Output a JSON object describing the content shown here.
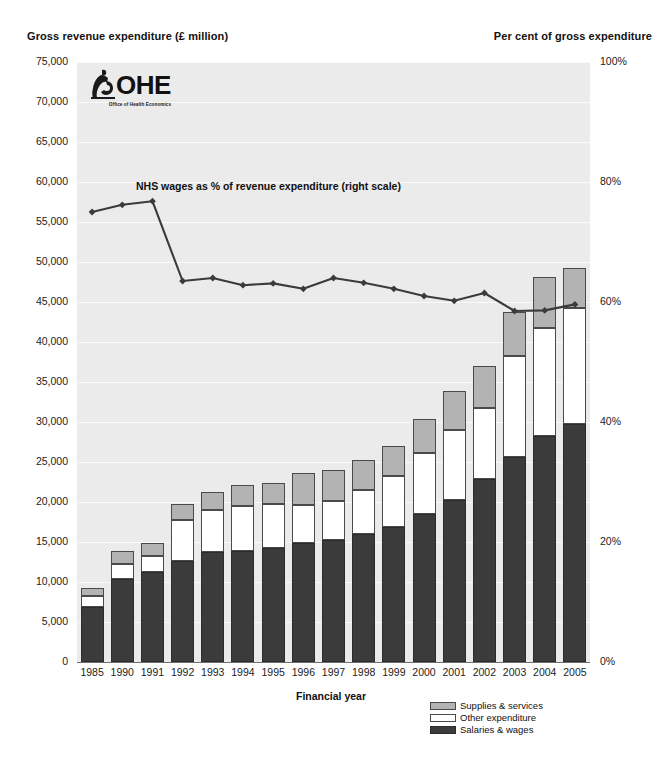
{
  "header": {
    "left_axis_title": "Gross revenue expenditure (£ million)",
    "right_axis_title": "Per cent of gross expenditure"
  },
  "logo": {
    "wordmark": "OHE",
    "subtitle": "Office of Health Economics",
    "icon": "ohe-figure-icon"
  },
  "annotation": {
    "line_label": "NHS wages as % of revenue expenditure (right scale)"
  },
  "legend": {
    "position": "bottom-right",
    "items": [
      {
        "label": "Supplies & services",
        "color": "#b3b3b3",
        "key": "supplies"
      },
      {
        "label": "Other expenditure",
        "color": "#ffffff",
        "key": "other"
      },
      {
        "label": "Salaries & wages",
        "color": "#3b3b3b",
        "key": "salaries"
      }
    ]
  },
  "chart_data": {
    "type": "bar",
    "title": "",
    "xlabel": "Financial year",
    "ylabel": "Gross revenue expenditure (£ million)",
    "y2label": "Per cent of gross expenditure",
    "stacked": true,
    "grid": true,
    "ylim": [
      0,
      75000
    ],
    "y2lim": [
      0,
      100
    ],
    "yticks": [
      "0",
      "5,000",
      "10,000",
      "15,000",
      "20,000",
      "25,000",
      "30,000",
      "35,000",
      "40,000",
      "45,000",
      "50,000",
      "55,000",
      "60,000",
      "65,000",
      "70,000",
      "75,000"
    ],
    "ytick_values": [
      0,
      5000,
      10000,
      15000,
      20000,
      25000,
      30000,
      35000,
      40000,
      45000,
      50000,
      55000,
      60000,
      65000,
      70000,
      75000
    ],
    "y2ticks": [
      "0%",
      "20%",
      "40%",
      "60%",
      "80%",
      "100%"
    ],
    "y2tick_values": [
      0,
      20,
      40,
      60,
      80,
      100
    ],
    "categories": [
      "1985",
      "1990",
      "1991",
      "1992",
      "1993",
      "1994",
      "1995",
      "1996",
      "1997",
      "1998",
      "1999",
      "2000",
      "2001",
      "2002",
      "2003",
      "2004",
      "2005"
    ],
    "series": [
      {
        "name": "Salaries & wages",
        "color": "#3b3b3b",
        "values": [
          6900,
          10400,
          11300,
          12600,
          13700,
          13900,
          14300,
          14900,
          15200,
          16000,
          16900,
          18500,
          20200,
          22900,
          25600,
          28200,
          29700
        ]
      },
      {
        "name": "Other expenditure",
        "color": "#ffffff",
        "values": [
          1350,
          1900,
          1900,
          5100,
          5300,
          5600,
          5400,
          4700,
          4900,
          5500,
          6300,
          7600,
          8800,
          8900,
          12600,
          13600,
          14500
        ]
      },
      {
        "name": "Supplies & services",
        "color": "#b3b3b3",
        "values": [
          1050,
          1600,
          1700,
          2000,
          2200,
          2600,
          2700,
          4000,
          3900,
          3700,
          3800,
          4300,
          4900,
          5200,
          5600,
          6300,
          5100
        ]
      }
    ],
    "totals": [
      9300,
      13900,
      14900,
      19700,
      21200,
      22100,
      22400,
      23600,
      24000,
      25200,
      27000,
      30400,
      33900,
      37000,
      43800,
      48100,
      49300
    ],
    "line_series": {
      "name": "NHS wages as % of revenue expenditure (right scale)",
      "axis": "right",
      "color": "#3b3b3b",
      "marker": "diamond",
      "values": [
        75.0,
        76.2,
        76.8,
        63.5,
        64.0,
        62.8,
        63.1,
        62.2,
        64.0,
        63.2,
        62.2,
        61.0,
        60.2,
        61.5,
        58.5,
        58.6,
        59.6
      ]
    }
  }
}
